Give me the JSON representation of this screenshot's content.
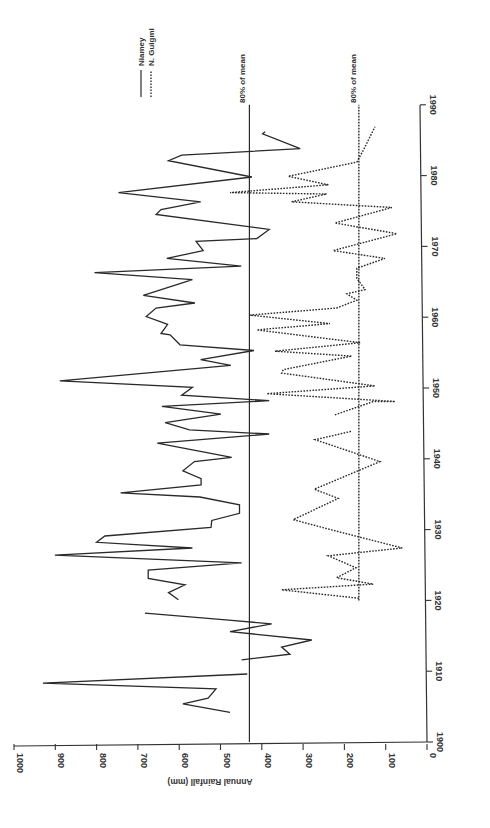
{
  "chart_data": {
    "type": "line",
    "orientation": "rotated-90-ccw",
    "title": "",
    "xlabel": "",
    "ylabel": "Annual Rainfall (mm)",
    "x_axis": {
      "range": [
        1900,
        1990
      ],
      "ticks": [
        1900,
        1910,
        1920,
        1930,
        1940,
        1950,
        1960,
        1970,
        1980,
        1990
      ]
    },
    "y_axis": {
      "range": [
        0,
        1000
      ],
      "ticks": [
        0,
        100,
        200,
        300,
        400,
        500,
        600,
        700,
        800,
        900,
        1000
      ]
    },
    "grid": false,
    "legend": {
      "position": "top-right (rotated)",
      "entries": [
        {
          "name": "Niamey",
          "style": "solid"
        },
        {
          "name": "N. Guigmi",
          "style": "dotted"
        }
      ]
    },
    "reference_lines": [
      {
        "label": "80% of mean",
        "series": "Niamey",
        "value": 430,
        "style": "solid",
        "x_from": 1900,
        "x_to": 1990
      },
      {
        "label": "80% of mean",
        "series": "N. Guigmi",
        "value": 165,
        "style": "dotted",
        "x_from": 1920,
        "x_to": 1990
      }
    ],
    "series": [
      {
        "name": "Niamey",
        "style": "solid",
        "segments": [
          [
            [
              1904.2,
              477
            ],
            [
              1905.4,
              591
            ],
            [
              1906.2,
              530
            ],
            [
              1907.5,
              511
            ],
            [
              1908.3,
              930
            ],
            [
              1909.6,
              435
            ]
          ],
          [
            [
              1911.6,
              449
            ],
            [
              1912.4,
              332
            ],
            [
              1913.4,
              352
            ],
            [
              1914.4,
              279
            ],
            [
              1915.6,
              477
            ],
            [
              1916.7,
              376
            ],
            [
              1917.2,
              480
            ],
            [
              1918.2,
              683
            ]
          ],
          [
            [
              1920.1,
              602
            ],
            [
              1921.1,
              626
            ],
            [
              1922.2,
              586
            ],
            [
              1923.1,
              675
            ],
            [
              1924.3,
              675
            ],
            [
              1925.3,
              449
            ],
            [
              1926.4,
              901
            ],
            [
              1927.4,
              568
            ],
            [
              1928.2,
              800
            ],
            [
              1929.1,
              780
            ],
            [
              1930.3,
              523
            ],
            [
              1931.3,
              521
            ],
            [
              1932.3,
              454
            ],
            [
              1933.5,
              454
            ],
            [
              1934.6,
              550
            ],
            [
              1935.2,
              742
            ],
            [
              1936.3,
              547
            ],
            [
              1937.2,
              547
            ],
            [
              1938.3,
              591
            ],
            [
              1939.6,
              563
            ],
            [
              1940.2,
              473
            ],
            [
              1942.2,
              653
            ],
            [
              1943.5,
              382
            ],
            [
              1944.1,
              575
            ],
            [
              1945.1,
              634
            ],
            [
              1946.3,
              499
            ],
            [
              1947.4,
              642
            ],
            [
              1948.2,
              382
            ],
            [
              1949.0,
              594
            ],
            [
              1950.1,
              568
            ],
            [
              1951.0,
              889
            ],
            [
              1953.2,
              475
            ],
            [
              1954.0,
              548
            ],
            [
              1955.3,
              419
            ],
            [
              1956.1,
              598
            ],
            [
              1957.5,
              622
            ],
            [
              1957.7,
              644
            ],
            [
              1959.0,
              628
            ],
            [
              1960.1,
              680
            ],
            [
              1961.3,
              656
            ],
            [
              1962.0,
              562
            ],
            [
              1963.1,
              687
            ],
            [
              1965.3,
              568
            ],
            [
              1966.3,
              805
            ],
            [
              1967.2,
              450
            ],
            [
              1968.3,
              630
            ],
            [
              1969.4,
              542
            ],
            [
              1970.7,
              559
            ],
            [
              1971.1,
              412
            ],
            [
              1972.4,
              382
            ],
            [
              1974.5,
              656
            ],
            [
              1975.2,
              644
            ],
            [
              1976.3,
              548
            ],
            [
              1977.6,
              747
            ],
            [
              1979.8,
              424
            ],
            [
              1982.1,
              626
            ],
            [
              1982.9,
              594
            ],
            [
              1983.8,
              307
            ],
            [
              1985.9,
              398
            ],
            [
              1986.2,
              392
            ]
          ]
        ]
      },
      {
        "name": "N. Guigmi",
        "style": "dotted",
        "segments": [
          [
            [
              1920.3,
              165
            ],
            [
              1921.5,
              352
            ],
            [
              1922.3,
              130
            ],
            [
              1923.2,
              219
            ],
            [
              1924.6,
              172
            ],
            [
              1926.3,
              239
            ],
            [
              1927.4,
              60
            ],
            [
              1929.9,
              227
            ],
            [
              1931.4,
              324
            ],
            [
              1934.4,
              215
            ],
            [
              1935.7,
              273
            ],
            [
              1939.6,
              114
            ],
            [
              1942.7,
              271
            ],
            [
              1943.9,
              182
            ]
          ],
          [
            [
              1946.2,
              223
            ],
            [
              1948.1,
              130
            ],
            [
              1948.1,
              77
            ],
            [
              1949.2,
              388
            ],
            [
              1950.3,
              126
            ],
            [
              1952.1,
              352
            ],
            [
              1952.6,
              348
            ],
            [
              1954.5,
              182
            ],
            [
              1955.2,
              368
            ],
            [
              1956.4,
              162
            ],
            [
              1958.2,
              412
            ],
            [
              1959.1,
              235
            ],
            [
              1960.3,
              429
            ],
            [
              1961.3,
              219
            ],
            [
              1962.4,
              170
            ],
            [
              1963.3,
              194
            ],
            [
              1963.9,
              150
            ],
            [
              1965.5,
              170
            ],
            [
              1966.9,
              170
            ],
            [
              1968.3,
              102
            ],
            [
              1969.4,
              227
            ],
            [
              1971.8,
              73
            ],
            [
              1973.3,
              223
            ],
            [
              1975.5,
              85
            ],
            [
              1976.3,
              328
            ],
            [
              1977.4,
              243
            ],
            [
              1977.6,
              477
            ],
            [
              1978.7,
              239
            ],
            [
              1979.9,
              336
            ],
            [
              1981.9,
              170
            ],
            [
              1983.6,
              154
            ],
            [
              1986.9,
              126
            ]
          ]
        ]
      }
    ]
  },
  "labels": {
    "ylabel": "Annual Rainfall (mm)",
    "legend_niamey": "Niamey",
    "legend_guigmi": "N. Guigmi",
    "ref_niamey": "80% of mean",
    "ref_guigmi": "80% of mean"
  }
}
